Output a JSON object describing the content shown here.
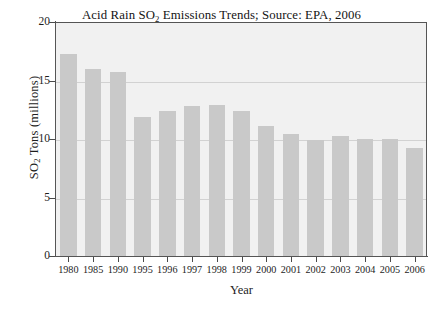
{
  "chart_data": {
    "type": "bar",
    "title": "Acid Rain SO2 Emissions Trends; Source: EPA, 2006",
    "title_parts": {
      "before_sub": "Acid Rain SO",
      "sub": "2",
      "after_sub": " Emissions Trends; Source: EPA, 2006"
    },
    "xlabel": "Year",
    "ylabel": "SO2 Tons (millions)",
    "ylabel_parts": {
      "before_sub": "SO",
      "sub": "2",
      "after_sub": " Tons (millions)"
    },
    "categories": [
      "1980",
      "1985",
      "1990",
      "1995",
      "1996",
      "1997",
      "1998",
      "1999",
      "2000",
      "2001",
      "2002",
      "2003",
      "2004",
      "2005",
      "2006"
    ],
    "values": [
      17.3,
      16.0,
      15.7,
      11.9,
      12.4,
      12.8,
      12.9,
      12.4,
      11.1,
      10.4,
      9.9,
      10.3,
      10.0,
      10.0,
      9.2
    ],
    "ylim": [
      0,
      20
    ],
    "yticks": [
      0,
      5,
      10,
      15,
      20
    ],
    "ytick_labels": [
      "0",
      "5",
      "10",
      "15",
      "20"
    ],
    "grid": true,
    "legend": false,
    "colors": {
      "bar_fill": "#c9c9c9",
      "plot_background": "#f1f1f1",
      "gridline": "#d2d2d2",
      "axis": "#555555",
      "text": "#1d1d1d"
    }
  }
}
